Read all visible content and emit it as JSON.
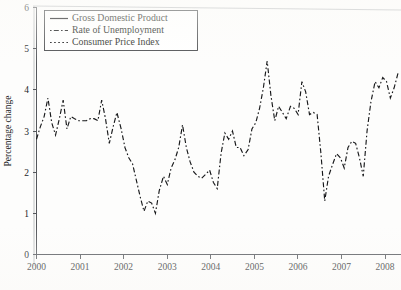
{
  "chart_data": {
    "type": "line",
    "title": "",
    "xlabel": "",
    "ylabel": "Percentage change",
    "xlim": [
      2000,
      2008.6
    ],
    "ylim": [
      0,
      6
    ],
    "ytick_labels": [
      "0",
      "1",
      "2",
      "3",
      "4",
      "5",
      "6"
    ],
    "ytick_values": [
      0,
      1,
      2,
      3,
      4,
      5,
      6
    ],
    "xtick_labels": [
      "2000",
      "2001",
      "2002",
      "2003",
      "2004",
      "2005",
      "2006",
      "2007",
      "2008"
    ],
    "xtick_values": [
      2000,
      2001,
      2002,
      2003,
      2004,
      2005,
      2006,
      2007,
      2008
    ],
    "grid": false,
    "legend_position": "upper left",
    "legend_entries": [
      {
        "label": "Gross Domestic Product",
        "style": "solid"
      },
      {
        "label": "Rate of Unemployment",
        "style": "dash-dot"
      },
      {
        "label": "Consumer Price Index",
        "style": "dotted"
      }
    ],
    "series": [
      {
        "name": "Rate of Unemployment",
        "style": "dash-dot",
        "x": [
          2000.0,
          2000.09,
          2000.18,
          2000.27,
          2000.36,
          2000.45,
          2000.54,
          2000.63,
          2000.72,
          2000.81,
          2000.9,
          2001.0,
          2001.09,
          2001.18,
          2001.27,
          2001.36,
          2001.45,
          2001.54,
          2001.63,
          2001.72,
          2001.81,
          2001.9,
          2002.0,
          2002.09,
          2002.18,
          2002.27,
          2002.36,
          2002.45,
          2002.54,
          2002.63,
          2002.72,
          2002.81,
          2002.9,
          2003.0,
          2003.09,
          2003.18,
          2003.27,
          2003.36,
          2003.45,
          2003.54,
          2003.63,
          2003.72,
          2003.81,
          2003.9,
          2004.0,
          2004.09,
          2004.18,
          2004.27,
          2004.36,
          2004.45,
          2004.54,
          2004.63,
          2004.72,
          2004.81,
          2004.9,
          2005.0,
          2005.09,
          2005.18,
          2005.27,
          2005.36,
          2005.45,
          2005.54,
          2005.63,
          2005.72,
          2005.81,
          2005.9,
          2006.0,
          2006.09,
          2006.18,
          2006.27,
          2006.36,
          2006.45,
          2006.54,
          2006.63,
          2006.72,
          2006.81,
          2006.9,
          2007.0,
          2007.09,
          2007.18,
          2007.27,
          2007.36,
          2007.45,
          2007.54,
          2007.63,
          2007.72,
          2007.81,
          2007.9,
          2008.0,
          2008.09,
          2008.18,
          2008.27,
          2008.36,
          2008.45,
          2008.54
        ],
        "y": [
          2.8,
          3.1,
          3.35,
          3.8,
          3.2,
          2.9,
          3.3,
          3.75,
          3.05,
          3.35,
          3.3,
          3.25,
          3.25,
          3.25,
          3.3,
          3.3,
          3.25,
          3.75,
          3.3,
          2.7,
          3.1,
          3.45,
          3.05,
          2.6,
          2.35,
          2.2,
          1.8,
          1.4,
          1.05,
          1.3,
          1.25,
          1.0,
          1.55,
          1.9,
          1.7,
          2.1,
          2.3,
          2.6,
          3.15,
          2.6,
          2.25,
          2.0,
          1.9,
          1.85,
          1.95,
          2.05,
          1.75,
          1.6,
          2.45,
          2.95,
          2.8,
          3.0,
          2.6,
          2.6,
          2.4,
          2.55,
          3.05,
          3.2,
          3.55,
          4.05,
          4.7,
          3.85,
          3.25,
          3.6,
          3.45,
          3.3,
          3.6,
          3.55,
          3.4,
          4.2,
          3.95,
          3.4,
          3.45,
          3.4,
          2.45,
          1.3,
          1.9,
          2.2,
          2.45,
          2.35,
          2.1,
          2.6,
          2.75,
          2.7,
          2.35,
          1.9,
          3.0,
          3.7,
          4.2,
          4.05,
          4.3,
          4.2,
          3.8,
          4.05,
          4.4
        ]
      }
    ]
  },
  "axes": {
    "ylabel": "Percentage change"
  }
}
